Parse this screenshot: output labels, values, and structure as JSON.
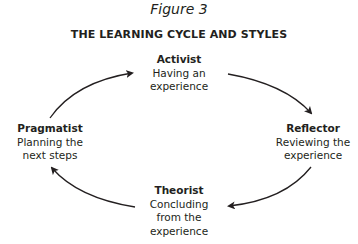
{
  "figure_label": "Figure 3",
  "title": "THE LEARNING CYCLE AND STYLES",
  "nodes": {
    "activist": {
      "name": "Activist",
      "desc_lines": [
        "Having an",
        "experience"
      ]
    },
    "reflector": {
      "name": "Reflector",
      "desc_lines": [
        "Reviewing the",
        "experience"
      ]
    },
    "theorist": {
      "name": "Theorist",
      "desc_lines": [
        "Concluding",
        "from the",
        "experience"
      ]
    },
    "pragmatist": {
      "name": "Pragmatist",
      "desc_lines": [
        "Planning the",
        "next steps"
      ]
    }
  },
  "arrows": [
    {
      "from": "pragmatist",
      "to": "activist"
    },
    {
      "from": "activist",
      "to": "reflector"
    },
    {
      "from": "reflector",
      "to": "theorist"
    },
    {
      "from": "theorist",
      "to": "pragmatist"
    }
  ],
  "colors": {
    "text": "#231f20",
    "arrow": "#231f20",
    "background": "#ffffff"
  }
}
